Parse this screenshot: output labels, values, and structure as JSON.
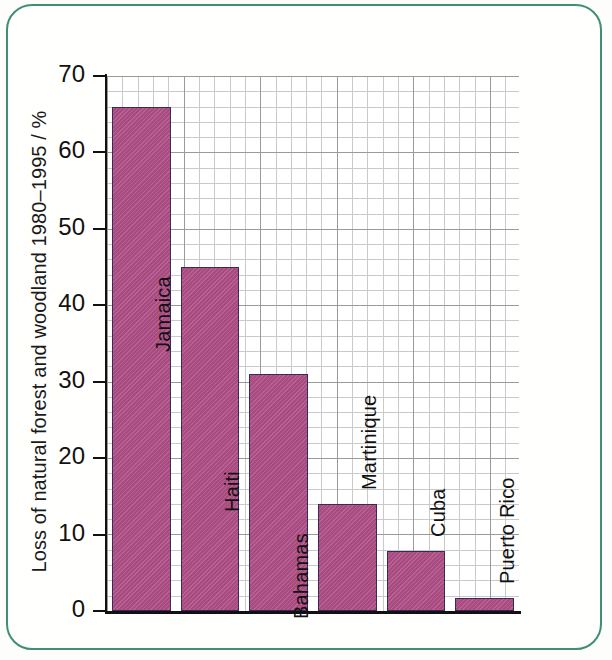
{
  "figure": {
    "frame_color": "#3f8f73",
    "background": "#fffffd"
  },
  "chart_data": {
    "type": "bar",
    "title": "",
    "xlabel": "",
    "ylabel": "Loss of natural forest and woodland 1980–1995 / %",
    "ylim": [
      0,
      70
    ],
    "ytick_labels": [
      "0",
      "10",
      "20",
      "30",
      "40",
      "50",
      "60",
      "70"
    ],
    "ytick_values": [
      0,
      10,
      20,
      30,
      40,
      50,
      60,
      70
    ],
    "grid": true,
    "legend": "none",
    "bar_color": "#a94a80",
    "bar_edge_color": "#3a2a57",
    "categories": [
      "Jamaica",
      "Haiti",
      "Bahamas",
      "Martinique",
      "Cuba",
      "Puerto Rico"
    ],
    "values": [
      66,
      45,
      31,
      14,
      7.8,
      1.7
    ],
    "labels_inside_bars": true
  }
}
